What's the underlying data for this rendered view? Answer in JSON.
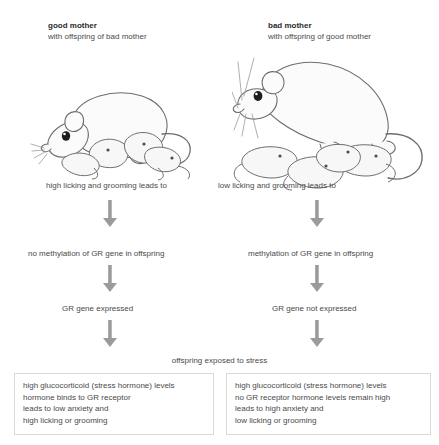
{
  "columns": {
    "left": {
      "title": "good mother",
      "subtitle": "with offspring of bad mother",
      "illustration_name": "rat-mother-nursing-pups-illustration",
      "licking": "high licking and grooming leads to",
      "methylation": "no methylation of GR gene in offspring",
      "expression": "GR gene expressed",
      "outcome": [
        "high glucocorticoid (stress hormone) levels",
        "hormone binds to GR receptor",
        "leads to low anxiety and",
        "high licking or grooming"
      ]
    },
    "right": {
      "title": "bad mother",
      "subtitle": "with offspring of good mother",
      "illustration_name": "rat-mother-upright-with-pups-illustration",
      "licking": "low licking and grooming leads to",
      "methylation": "methylation of GR gene in offspring",
      "expression": "GR gene not expressed",
      "outcome": [
        "high glucocorticoid (stress hormone) levels",
        "no GR receptor hormone levels remain high",
        "leads to high anxiety and",
        "low licking or grooming"
      ]
    }
  },
  "center_label": "offspring exposed to stress",
  "colors": {
    "text": "#4a4a4a",
    "heading": "#2b2b2b",
    "arrow": "#9b9b9b",
    "box_border": "#d9d9d9",
    "background": "#ffffff"
  }
}
